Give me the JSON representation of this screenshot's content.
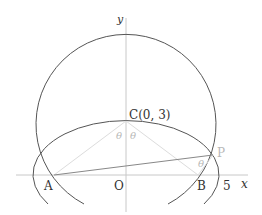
{
  "diagram": {
    "axes": {
      "x_label": "x",
      "y_label": "y",
      "origin_label": "O"
    },
    "points": {
      "A": {
        "label": "A",
        "coords": [
          -4,
          0
        ]
      },
      "B": {
        "label": "B",
        "coords": [
          4,
          0
        ]
      },
      "C": {
        "label": "C(0, 3)",
        "coords": [
          0,
          3
        ]
      },
      "P": {
        "label": "P"
      }
    },
    "tick_labels": [
      "5"
    ],
    "angle_labels": [
      "θ",
      "θ",
      "θ"
    ],
    "shapes": {
      "ellipse": {
        "center": [
          0,
          0
        ],
        "a": 5,
        "b": 3
      },
      "circle": {
        "center": [
          0,
          3
        ],
        "radius": 5
      }
    },
    "colors": {
      "curve": "#555555",
      "axis": "#c8c8c8",
      "faint_line": "#d8d8d8",
      "segment": "#888888"
    }
  }
}
